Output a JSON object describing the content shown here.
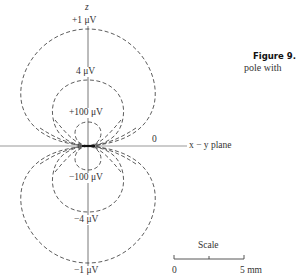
{
  "figure": {
    "caption_title": "Figure 9.",
    "caption_text": "pole with"
  },
  "axes": {
    "z_label": "z",
    "plane_label": "x − y plane",
    "zero_label": "0"
  },
  "contours": {
    "upper": [
      {
        "label": "+1 μV",
        "value_uV": 1
      },
      {
        "label": "4 μV",
        "value_uV": 4
      },
      {
        "label": "+100 μV",
        "value_uV": 100
      }
    ],
    "lower": [
      {
        "label": "−100 μV",
        "value_uV": -100
      },
      {
        "label": "−4 μV",
        "value_uV": -4
      },
      {
        "label": "−1 μV",
        "value_uV": -1
      }
    ]
  },
  "scale": {
    "title": "Scale",
    "start_label": "0",
    "end_label": "5 mm"
  },
  "colors": {
    "line": "#333333",
    "axis": "#888888",
    "background": "#ffffff"
  }
}
